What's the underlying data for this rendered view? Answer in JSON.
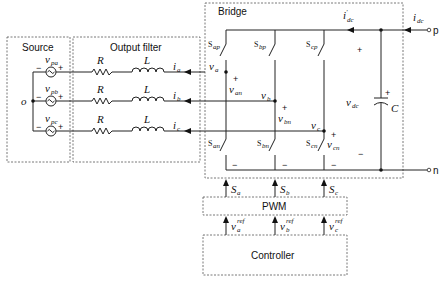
{
  "blocks": {
    "source": "Source",
    "filter": "Output filter",
    "bridge": "Bridge",
    "pwm": "PWM",
    "controller": "Controller"
  },
  "source": {
    "neutral": "o",
    "phases": [
      {
        "v": "v",
        "sub": "pa"
      },
      {
        "v": "v",
        "sub": "pb"
      },
      {
        "v": "v",
        "sub": "pc"
      }
    ],
    "minus": "−",
    "plus": "+"
  },
  "filter": {
    "resistor": "R",
    "inductor": "L",
    "currents": [
      {
        "i": "i",
        "sub": "a"
      },
      {
        "i": "i",
        "sub": "b"
      },
      {
        "i": "i",
        "sub": "c"
      }
    ]
  },
  "bridge": {
    "node_voltages": [
      {
        "v": "v",
        "sub": "a"
      },
      {
        "v": "v",
        "sub": "b"
      },
      {
        "v": "v",
        "sub": "c"
      }
    ],
    "leg_voltages": [
      {
        "v": "v",
        "sub": "an"
      },
      {
        "v": "v",
        "sub": "bn"
      },
      {
        "v": "v",
        "sub": "cn"
      }
    ],
    "switches_upper": [
      {
        "s": "S",
        "sub": "ap"
      },
      {
        "s": "S",
        "sub": "bp"
      },
      {
        "s": "S",
        "sub": "cp"
      }
    ],
    "switches_lower": [
      {
        "s": "S",
        "sub": "an"
      },
      {
        "s": "S",
        "sub": "bn"
      },
      {
        "s": "S",
        "sub": "cn"
      }
    ],
    "plus": "+",
    "minus": "−",
    "idc_inner": {
      "i": "i",
      "prime": "′",
      "sub": "dc"
    },
    "vdc": {
      "v": "v",
      "sub": "dc"
    },
    "capacitor": "C",
    "cap_plus": "+"
  },
  "dc_port": {
    "idc": {
      "i": "i",
      "sub": "dc"
    },
    "p": "p",
    "n": "n"
  },
  "gating": [
    {
      "s": "S",
      "sub": "a"
    },
    {
      "s": "S",
      "sub": "b"
    },
    {
      "s": "S",
      "sub": "c"
    }
  ],
  "references": [
    {
      "v": "v",
      "sub": "a",
      "sup": "ref"
    },
    {
      "v": "v",
      "sub": "b",
      "sup": "ref"
    },
    {
      "v": "v",
      "sub": "c",
      "sup": "ref"
    }
  ]
}
